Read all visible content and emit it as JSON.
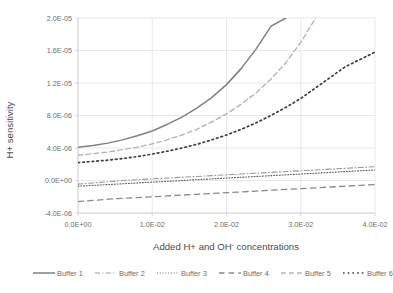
{
  "chart_data": {
    "type": "line",
    "title": "",
    "xlabel": "Added H+ and OH- concentrations",
    "ylabel": "H+ sensitivity",
    "xlim": [
      0.0,
      0.04
    ],
    "ylim": [
      -4e-06,
      2e-05
    ],
    "grid": true,
    "legend_position": "bottom",
    "xticklabels": [
      "0.0E+00",
      "1.0E-02",
      "2.0E-02",
      "3.0E-02",
      "4.0E-02"
    ],
    "xtickvalues": [
      0.0,
      0.01,
      0.02,
      0.03,
      0.04
    ],
    "yticklabels": [
      "-4.0E-06",
      "0.0E+00",
      "4.0E-06",
      "8.0E-06",
      "1.2E-05",
      "1.6E-05",
      "2.0E-05"
    ],
    "ytickvalues": [
      -4e-06,
      0.0,
      4e-06,
      8e-06,
      1.2e-05,
      1.6e-05,
      2e-05
    ],
    "x": [
      0.0,
      0.002,
      0.004,
      0.006,
      0.008,
      0.01,
      0.012,
      0.014,
      0.016,
      0.018,
      0.02,
      0.022,
      0.024,
      0.026,
      0.028,
      0.03,
      0.032,
      0.034,
      0.036,
      0.038,
      0.04
    ],
    "series": [
      {
        "name": "Buffer 1",
        "style": "solid",
        "color": "#808080",
        "width": 1.5,
        "values": [
          4.1e-06,
          4.3e-06,
          4.6e-06,
          5e-06,
          5.5e-06,
          6.1e-06,
          6.9e-06,
          7.8e-06,
          8.9e-06,
          1.02e-05,
          1.18e-05,
          1.38e-05,
          1.62e-05,
          1.9e-05,
          2e-05,
          null,
          null,
          null,
          null,
          null,
          null
        ]
      },
      {
        "name": "Buffer 2",
        "style": "dashdot",
        "color": "#9a9a9a",
        "width": 1.1,
        "values": [
          -4.5e-07,
          -3e-07,
          -1.5e-07,
          0.0,
          1e-07,
          2e-07,
          3e-07,
          4e-07,
          5e-07,
          6e-07,
          7e-07,
          8e-07,
          9e-07,
          1e-06,
          1.1e-06,
          1.2e-06,
          1.3e-06,
          1.4e-06,
          1.5e-06,
          1.6e-06,
          1.7e-06
        ]
      },
      {
        "name": "Buffer 3",
        "style": "fine-dotted",
        "color": "#5a5a5a",
        "width": 1.1,
        "values": [
          -7e-07,
          -6e-07,
          -5e-07,
          -4e-07,
          -3e-07,
          -2e-07,
          -1e-07,
          0.0,
          1e-07,
          2e-07,
          3e-07,
          4e-07,
          5e-07,
          6e-07,
          7e-07,
          8e-07,
          9e-07,
          1e-06,
          1.1e-06,
          1.2e-06,
          1.3e-06
        ]
      },
      {
        "name": "Buffer 4",
        "style": "longdash",
        "color": "#8a8a8a",
        "width": 1.3,
        "values": [
          -2.6e-06,
          -2.45e-06,
          -2.3e-06,
          -2.2e-06,
          -2.1e-06,
          -2e-06,
          -1.9e-06,
          -1.8e-06,
          -1.7e-06,
          -1.6e-06,
          -1.5e-06,
          -1.4e-06,
          -1.3e-06,
          -1.2e-06,
          -1.1e-06,
          -1e-06,
          -9e-07,
          -8e-07,
          -7e-07,
          -6e-07,
          -5e-07
        ]
      },
      {
        "name": "Buffer 5",
        "style": "dashed",
        "color": "#b5b5b5",
        "width": 1.4,
        "values": [
          3.1e-06,
          3.3e-06,
          3.5e-06,
          3.8e-06,
          4.1e-06,
          4.5e-06,
          5e-06,
          5.6e-06,
          6.3e-06,
          7.2e-06,
          8.2e-06,
          9.4e-06,
          1.08e-05,
          1.25e-05,
          1.45e-05,
          1.7e-05,
          2e-05,
          null,
          null,
          null,
          null
        ]
      },
      {
        "name": "Buffer 6",
        "style": "bold-dotted",
        "color": "#3d3d3d",
        "width": 1.7,
        "values": [
          2.2e-06,
          2.35e-06,
          2.5e-06,
          2.7e-06,
          2.95e-06,
          3.25e-06,
          3.6e-06,
          4e-06,
          4.45e-06,
          5e-06,
          5.6e-06,
          6.3e-06,
          7.1e-06,
          8e-06,
          9e-06,
          1.01e-05,
          1.14e-05,
          1.27e-05,
          1.4e-05,
          1.49e-05,
          1.58e-05
        ]
      }
    ],
    "lower_band_series": [
      {
        "name": "Buffer 3 band",
        "ref": "Buffer 3"
      }
    ]
  },
  "legend": {
    "entries": [
      {
        "label": "Buffer 1"
      },
      {
        "label": "Buffer 2"
      },
      {
        "label": "Buffer 3"
      },
      {
        "label": "Buffer 4"
      },
      {
        "label": "Buffer 5"
      },
      {
        "label": "Buffer 6"
      }
    ]
  }
}
